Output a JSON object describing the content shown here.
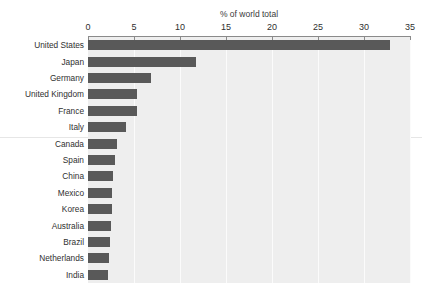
{
  "chart_data": {
    "type": "bar",
    "orientation": "horizontal",
    "title": "% of world total",
    "xlabel": "% of world total",
    "ylabel": "",
    "xlim": [
      0,
      35
    ],
    "xticks": [
      0,
      5,
      10,
      15,
      20,
      25,
      30,
      35
    ],
    "xtick_labels": [
      "0",
      "5",
      "10",
      "15",
      "20",
      "25",
      "30",
      "35"
    ],
    "grid": true,
    "grid_axis": "x",
    "legend": false,
    "axis_position": "top",
    "plot_background": "#eeeeee",
    "bar_color": "#595959",
    "categories": [
      "United States",
      "Japan",
      "Germany",
      "United Kingdom",
      "France",
      "Italy",
      "Canada",
      "Spain",
      "China",
      "Mexico",
      "Korea",
      "Australia",
      "Brazil",
      "Netherlands",
      "India"
    ],
    "values": [
      32.8,
      11.7,
      6.8,
      5.3,
      5.3,
      4.1,
      3.1,
      2.9,
      2.7,
      2.6,
      2.6,
      2.5,
      2.4,
      2.3,
      2.2
    ]
  },
  "colors": {
    "bar": "#595959",
    "plot_bg": "#eeeeee",
    "grid": "#fbfbfb",
    "axis": "#8a8a8a",
    "text": "#303030",
    "rule": "#e6e6e6"
  }
}
